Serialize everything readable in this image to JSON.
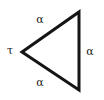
{
  "figure": {
    "type": "geometric-diagram",
    "shape": "triangle",
    "orientation": "apex-left",
    "background_color": "#ffffff",
    "stroke_color": "#151515",
    "stroke_width": 3,
    "text_color": "#1a1a1a",
    "vertices": {
      "apex_left": [
        22,
        52
      ],
      "top_right": [
        79,
        12
      ],
      "bottom_right": [
        79,
        90
      ]
    },
    "labels": {
      "apex": "τ",
      "upper_side": "α",
      "right_side": "α",
      "lower_side": "α"
    },
    "label_names": {
      "apex": "tau",
      "upper_side": "alpha",
      "right_side": "alpha",
      "lower_side": "alpha"
    }
  }
}
